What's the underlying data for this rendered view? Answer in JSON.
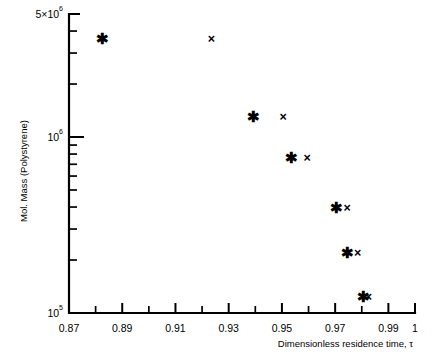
{
  "chart_data": {
    "type": "scatter",
    "title": "",
    "xlabel": "Dimensionless residence time, τ",
    "ylabel": "Mol. Mass (Polystyrene)",
    "xlim": [
      0.87,
      1.0
    ],
    "ylim": [
      100000,
      5000000
    ],
    "yscale": "log",
    "xscale": "linear",
    "grid": false,
    "legend": "none",
    "xticks": [
      0.87,
      0.89,
      0.91,
      0.93,
      0.95,
      0.97,
      0.99,
      1.0
    ],
    "xtick_labels": [
      "0.87",
      "0.89",
      "0.91",
      "0.93",
      "0.95",
      "0.97",
      "0.99",
      "1"
    ],
    "xminor_ticks": [
      0.88,
      0.9,
      0.92,
      0.94,
      0.96,
      0.98
    ],
    "yticks": [
      100000,
      1000000,
      5000000
    ],
    "ytick_labels": [
      "10⁵",
      "10⁶",
      "5×10⁶"
    ],
    "ytick_label_base": [
      "10",
      "10",
      "5×10"
    ],
    "ytick_label_exp": [
      "5",
      "6",
      "6"
    ],
    "yminor_ticks": [
      200000,
      300000,
      400000,
      500000,
      600000,
      700000,
      800000,
      900000,
      2000000,
      3000000,
      4000000
    ],
    "series": [
      {
        "name": "star-series",
        "marker": "star",
        "points": [
          {
            "x": 0.8825,
            "y": 3650000
          },
          {
            "x": 0.9395,
            "y": 1300000
          },
          {
            "x": 0.9535,
            "y": 760000
          },
          {
            "x": 0.9705,
            "y": 400000
          },
          {
            "x": 0.9745,
            "y": 222000
          },
          {
            "x": 0.9805,
            "y": 124000
          }
        ]
      },
      {
        "name": "x-series",
        "marker": "x",
        "points": [
          {
            "x": 0.9235,
            "y": 3650000
          },
          {
            "x": 0.9505,
            "y": 1300000
          },
          {
            "x": 0.9595,
            "y": 760000
          },
          {
            "x": 0.9745,
            "y": 400000
          },
          {
            "x": 0.9785,
            "y": 222000
          },
          {
            "x": 0.9825,
            "y": 124000
          }
        ]
      }
    ]
  },
  "axes": {
    "x_caption": "Dimensionless residence time, τ",
    "y_caption": "Mol. Mass (Polystyrene)",
    "top_label_base": "5×10",
    "top_label_exp": "6"
  }
}
